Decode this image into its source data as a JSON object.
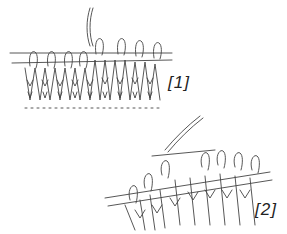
{
  "figure": {
    "steps": [
      {
        "label": "[1]",
        "stitches_on_needle": 8
      },
      {
        "label": "[2]",
        "stitches_on_needle": 9
      }
    ],
    "colors": {
      "line": "#333333",
      "background": "#ffffff"
    }
  }
}
